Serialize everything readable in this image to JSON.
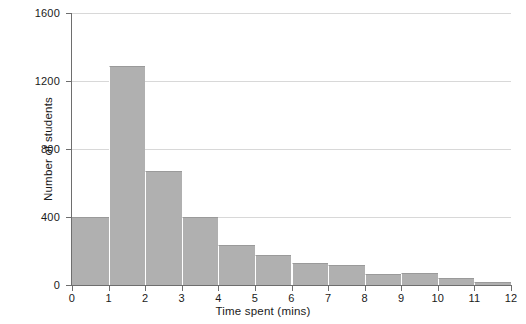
{
  "chart_data": {
    "type": "bar",
    "title": "",
    "xlabel": "Time spent (mins)",
    "ylabel": "Number of students",
    "categories": [
      "0-1",
      "1-2",
      "2-3",
      "3-4",
      "4-5",
      "5-6",
      "6-7",
      "7-8",
      "8-9",
      "9-10",
      "10-11",
      "11-12"
    ],
    "bin_edges": [
      0,
      1,
      2,
      3,
      4,
      5,
      6,
      7,
      8,
      9,
      10,
      11,
      12
    ],
    "values": [
      400,
      1290,
      670,
      400,
      235,
      175,
      130,
      115,
      65,
      70,
      40,
      20
    ],
    "xlim": [
      0,
      12
    ],
    "ylim": [
      0,
      1600
    ],
    "x_ticks": [
      "0",
      "1",
      "2",
      "3",
      "4",
      "5",
      "6",
      "7",
      "8",
      "9",
      "10",
      "11",
      "12"
    ],
    "y_ticks": [
      "0",
      "400",
      "800",
      "1200",
      "1600"
    ],
    "y_tick_values": [
      0,
      400,
      800,
      1200,
      1600
    ],
    "grid": "horizontal",
    "legend": "none",
    "bar_color": "#b0b0b0",
    "grid_color": "#d8d8d8",
    "axis_color": "#6e6e6e"
  }
}
